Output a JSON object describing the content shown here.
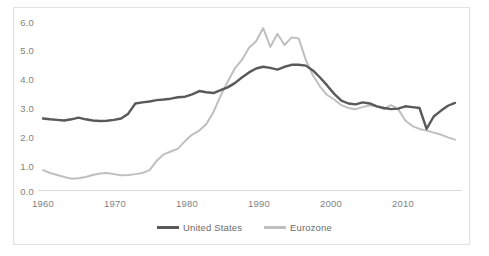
{
  "chart_data": {
    "type": "line",
    "title": "",
    "subtitle": "",
    "xlabel": "",
    "ylabel": "",
    "xlim": [
      1960,
      2018
    ],
    "ylim": [
      0.0,
      6.0
    ],
    "grid": false,
    "legend_position": "bottom-center",
    "xticks": [
      "1960",
      "1970",
      "1980",
      "1990",
      "2000",
      "2010"
    ],
    "xtick_values": [
      1960,
      1970,
      1980,
      1990,
      2000,
      2010
    ],
    "yticks": [
      "0.0",
      "1.0",
      "2.0",
      "3.0",
      "4.0",
      "5.0",
      "6.0"
    ],
    "ytick_values": [
      0.0,
      1.0,
      2.0,
      3.0,
      4.0,
      5.0,
      6.0
    ],
    "x": [
      1960,
      1961,
      1962,
      1963,
      1964,
      1965,
      1966,
      1967,
      1968,
      1969,
      1970,
      1971,
      1972,
      1973,
      1974,
      1975,
      1976,
      1977,
      1978,
      1979,
      1980,
      1981,
      1982,
      1983,
      1984,
      1985,
      1986,
      1987,
      1988,
      1989,
      1990,
      1991,
      1992,
      1993,
      1994,
      1995,
      1996,
      1997,
      1998,
      1999,
      2000,
      2001,
      2002,
      2003,
      2004,
      2005,
      2006,
      2007,
      2008,
      2009,
      2010,
      2011,
      2012,
      2013,
      2014,
      2015,
      2016,
      2017,
      2018
    ],
    "series": [
      {
        "name": "United States",
        "color": "#595959",
        "values": [
          2.55,
          2.52,
          2.5,
          2.48,
          2.52,
          2.58,
          2.52,
          2.48,
          2.46,
          2.47,
          2.5,
          2.55,
          2.72,
          3.08,
          3.12,
          3.15,
          3.2,
          3.22,
          3.25,
          3.3,
          3.32,
          3.4,
          3.52,
          3.48,
          3.45,
          3.55,
          3.65,
          3.8,
          4.0,
          4.18,
          4.32,
          4.38,
          4.34,
          4.28,
          4.38,
          4.45,
          4.45,
          4.42,
          4.25,
          4.0,
          3.72,
          3.42,
          3.18,
          3.08,
          3.05,
          3.12,
          3.08,
          2.98,
          2.92,
          2.88,
          2.9,
          2.98,
          2.95,
          2.92,
          2.18,
          2.62,
          2.82,
          3.0,
          3.1
        ]
      },
      {
        "name": "Eurozone",
        "color": "#bfbfbf",
        "values": [
          0.72,
          0.62,
          0.55,
          0.48,
          0.42,
          0.43,
          0.48,
          0.55,
          0.6,
          0.62,
          0.58,
          0.54,
          0.55,
          0.58,
          0.62,
          0.72,
          1.05,
          1.28,
          1.38,
          1.48,
          1.75,
          1.98,
          2.12,
          2.35,
          2.78,
          3.35,
          3.85,
          4.32,
          4.62,
          5.05,
          5.28,
          5.75,
          5.08,
          5.55,
          5.15,
          5.42,
          5.38,
          4.62,
          4.08,
          3.68,
          3.38,
          3.22,
          3.02,
          2.92,
          2.88,
          2.95,
          3.02,
          2.98,
          2.88,
          3.02,
          2.88,
          2.48,
          2.28,
          2.18,
          2.12,
          2.05,
          1.98,
          1.88,
          1.8
        ]
      }
    ]
  },
  "legend": {
    "entries": [
      {
        "label": "United States",
        "color": "#595959"
      },
      {
        "label": "Eurozone",
        "color": "#bfbfbf"
      }
    ]
  },
  "axis": {
    "baseline_color": "#d9d9d9",
    "tick_text_color": "#7f7f7f"
  },
  "frame": {
    "border_color": "#e2e2e2",
    "background": "#ffffff"
  }
}
